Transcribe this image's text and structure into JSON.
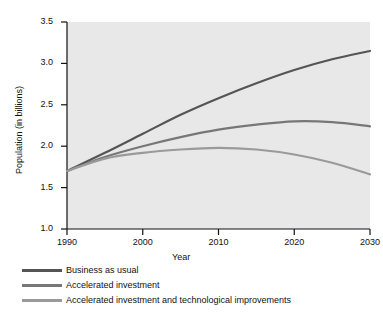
{
  "chart_data": {
    "type": "line",
    "title": "",
    "xlabel": "Year",
    "ylabel": "Population (in billions)",
    "xlim": [
      1990,
      2030
    ],
    "ylim": [
      1.0,
      3.5
    ],
    "xticks": [
      1990,
      2000,
      2010,
      2020,
      2030
    ],
    "xtick_labels": [
      "1990",
      "2000",
      "2010",
      "2020",
      "2030"
    ],
    "yticks": [
      1.0,
      1.5,
      2.0,
      2.5,
      3.0,
      3.5
    ],
    "ytick_labels": [
      "1.0",
      "1.5",
      "2.0",
      "2.5",
      "3.0",
      "3.5"
    ],
    "grid": false,
    "legend_position": "below-axes-left",
    "plot_background": "#e8e8e8",
    "x": [
      1990,
      1995,
      2000,
      2005,
      2010,
      2015,
      2020,
      2025,
      2030
    ],
    "series": [
      {
        "name": "Business as usual",
        "color": "#555555",
        "values": [
          1.7,
          1.92,
          2.15,
          2.38,
          2.58,
          2.76,
          2.92,
          3.05,
          3.15
        ]
      },
      {
        "name": "Accelerated investment",
        "color": "#777777",
        "values": [
          1.7,
          1.87,
          2.0,
          2.11,
          2.2,
          2.26,
          2.3,
          2.29,
          2.24
        ]
      },
      {
        "name": "Accelerated investment and technological improvements",
        "color": "#9a9a9a",
        "values": [
          1.7,
          1.85,
          1.92,
          1.96,
          1.98,
          1.96,
          1.9,
          1.8,
          1.66
        ]
      }
    ]
  },
  "legend": {
    "items": [
      {
        "label": "Business as usual",
        "color": "#555555"
      },
      {
        "label": "Accelerated investment",
        "color": "#777777"
      },
      {
        "label": "Accelerated investment and technological improvements",
        "color": "#9a9a9a"
      }
    ]
  }
}
